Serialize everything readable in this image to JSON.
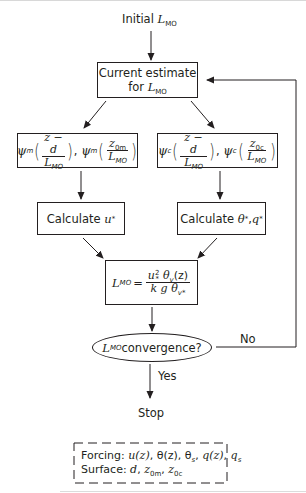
{
  "diagram": {
    "type": "flowchart",
    "start": {
      "text": "Initial",
      "var": "L",
      "sub": "MO"
    },
    "current_estimate": {
      "line1": "Current estimate",
      "line2_prefix": "for ",
      "var": "L",
      "sub": "MO"
    },
    "psi_momentum": {
      "func": "ψ",
      "func_sub": "m",
      "arg1_num": "z − d",
      "arg1_den_var": "L",
      "arg1_den_sub": "MO",
      "separator": ",",
      "arg2_num_var": "z",
      "arg2_num_sub": "0m",
      "arg2_den_var": "L",
      "arg2_den_sub": "MO"
    },
    "psi_scalar": {
      "func": "ψ",
      "func_sub": "c",
      "arg1_num": "z − d",
      "arg1_den_var": "L",
      "arg1_den_sub": "MO",
      "separator": ",",
      "arg2_num_var": "z",
      "arg2_num_sub": "0c",
      "arg2_den_var": "L",
      "arg2_den_sub": "MO"
    },
    "calc_u": {
      "text": "Calculate ",
      "var": "u",
      "sub": "*"
    },
    "calc_theta_q": {
      "text": "Calculate ",
      "var1": "θ",
      "sub1": "*",
      "sep": ", ",
      "var2": "q",
      "sub2": "*"
    },
    "formula": {
      "lhs_var": "L",
      "lhs_sub": "MO",
      "eq": "=",
      "num": {
        "u": "u",
        "u_sub": "*",
        "u_sup": "2",
        "theta": "θ",
        "theta_sub": "v",
        "arg": "(z)"
      },
      "den": {
        "k": "k",
        "g": "g",
        "theta": "θ",
        "theta_sub": "v*"
      }
    },
    "decision": {
      "var": "L",
      "sub": "MO",
      "text": " convergence?"
    },
    "branch_no": "No",
    "branch_yes": "Yes",
    "stop": "Stop",
    "inputs_box": {
      "forcing_label": "Forcing: ",
      "forcing_items": [
        "u(z)",
        "θ(z)",
        "θ",
        "q(z)",
        "q"
      ],
      "forcing_subs": [
        "",
        "",
        "s",
        "",
        "s"
      ],
      "surface_label": "Surface: ",
      "surface_items": [
        "d",
        "z",
        "z"
      ],
      "surface_subs": [
        "",
        "0m",
        "0c"
      ]
    }
  },
  "colors": {
    "stroke": "#231f20",
    "background": "#ffffff"
  }
}
